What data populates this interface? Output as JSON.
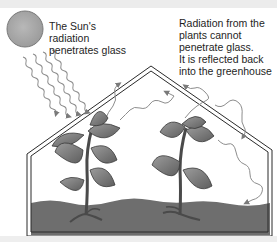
{
  "diagram": {
    "labels": {
      "sun_radiation": "The Sun's radiation penetrates glass",
      "sun_line1": "The Sun's radiation",
      "sun_line2": "penetrates glass",
      "reflected_line1": "Radiation from the",
      "reflected_line2": "plants cannot",
      "reflected_line3": "penetrate glass.",
      "reflected_line4": "It is reflected back",
      "reflected_line5": "into the greenhouse"
    },
    "elements": {
      "sun": "sun-icon",
      "incoming_rays": "wavy-arrows-incoming",
      "reflected_rays": "wavy-arrows-reflected",
      "glass": "greenhouse-glass-outline",
      "plants": [
        "plant-left",
        "plant-right"
      ],
      "soil": "soil"
    },
    "colors": {
      "sun": "#a9a9a9",
      "leaf": "#8a8a8a",
      "leaf_dark": "#5a5a5a",
      "stem": "#4a4a4a",
      "soil": "#6e6e6e",
      "glass": "#2a2a2a",
      "ray": "#8d8d8d"
    }
  }
}
